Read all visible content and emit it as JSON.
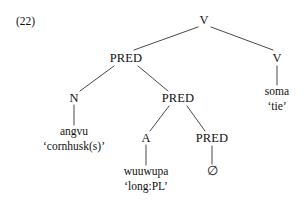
{
  "example": {
    "number_label": "(22)"
  },
  "colors": {
    "background": "#ffffff",
    "ink": "#111111",
    "branch": "#333333"
  },
  "tree": {
    "nodes": {
      "root_v": {
        "label": "V",
        "x": 204,
        "y": 20
      },
      "pred_upper": {
        "label": "PRED",
        "x": 126,
        "y": 58
      },
      "v_right": {
        "label": "V",
        "x": 277,
        "y": 58
      },
      "n_node": {
        "label": "N",
        "x": 74,
        "y": 98
      },
      "pred_middle": {
        "label": "PRED",
        "x": 178,
        "y": 98
      },
      "a_node": {
        "label": "A",
        "x": 146,
        "y": 138
      },
      "pred_lower": {
        "label": "PRED",
        "x": 212,
        "y": 138
      }
    },
    "leaves": {
      "soma": {
        "word": "soma",
        "gloss": "‘tie’",
        "x": 277,
        "y": 90
      },
      "angvu": {
        "word": "angvu",
        "gloss": "‘cornhusk(s)’",
        "x": 74,
        "y": 130
      },
      "wuuwupa": {
        "word": "wuuwupa",
        "gloss": "‘long:PL’",
        "x": 146,
        "y": 170
      },
      "null_pred": {
        "symbol": "∅",
        "x": 212,
        "y": 170
      }
    },
    "edges": [
      {
        "name": "root-v-to-pred-upper",
        "x1": 198,
        "y1": 27,
        "x2": 134,
        "y2": 50
      },
      {
        "name": "root-v-to-v-right",
        "x1": 211,
        "y1": 27,
        "x2": 273,
        "y2": 50
      },
      {
        "name": "v-right-to-soma",
        "x1": 277,
        "y1": 66,
        "x2": 277,
        "y2": 85
      },
      {
        "name": "pred-upper-to-n",
        "x1": 114,
        "y1": 66,
        "x2": 80,
        "y2": 91
      },
      {
        "name": "pred-upper-to-pred-middle",
        "x1": 138,
        "y1": 66,
        "x2": 168,
        "y2": 91
      },
      {
        "name": "n-to-angvu",
        "x1": 74,
        "y1": 105,
        "x2": 74,
        "y2": 125
      },
      {
        "name": "pred-middle-to-a",
        "x1": 169,
        "y1": 106,
        "x2": 150,
        "y2": 131
      },
      {
        "name": "pred-middle-to-pred-lower",
        "x1": 187,
        "y1": 106,
        "x2": 205,
        "y2": 131
      },
      {
        "name": "a-to-wuuwupa",
        "x1": 146,
        "y1": 145,
        "x2": 146,
        "y2": 165
      },
      {
        "name": "pred-lower-to-null",
        "x1": 212,
        "y1": 146,
        "x2": 212,
        "y2": 164
      }
    ]
  }
}
